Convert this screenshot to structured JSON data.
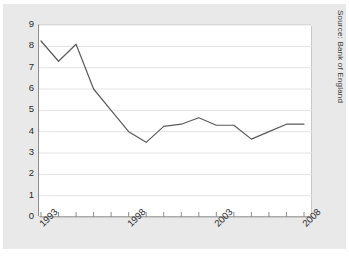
{
  "figure": {
    "source_note": "Source: Bank of England",
    "caption": ""
  },
  "colors": {
    "line": "#5a5a5a",
    "grid": "#e3e3e3",
    "axis": "#8d8d8d",
    "panel_background": "#e9e9e9",
    "plot_background": "#ffffff",
    "text": "#2b2b2b"
  },
  "chart_data": {
    "type": "line",
    "title": "",
    "xlabel": "",
    "ylabel": "",
    "xlim": [
      1993,
      2008
    ],
    "ylim": [
      0,
      9
    ],
    "ytick_step": 1,
    "grid": true,
    "legend": false,
    "yticks": [
      "0",
      "1",
      "2",
      "3",
      "4",
      "5",
      "6",
      "7",
      "8",
      "9"
    ],
    "xticks_all": [
      1993,
      1994,
      1995,
      1996,
      1997,
      1998,
      1999,
      2000,
      2001,
      2002,
      2003,
      2004,
      2005,
      2006,
      2007,
      2008
    ],
    "xticklabels": [
      "1993",
      "1998",
      "2003",
      "2008"
    ],
    "xticklabel_years": [
      1993,
      1998,
      2003,
      2008
    ],
    "x": [
      1993,
      1994,
      1995,
      1996,
      1997,
      1998,
      1999,
      2000,
      2001,
      2002,
      2003,
      2004,
      2005,
      2006,
      2007,
      2008
    ],
    "values": [
      8.25,
      7.3,
      8.1,
      6.0,
      5.0,
      4.0,
      3.5,
      4.25,
      4.35,
      4.65,
      4.3,
      4.3,
      3.65,
      4.0,
      4.35,
      4.35
    ],
    "series": [
      {
        "name": "rate",
        "values": [
          8.25,
          7.3,
          8.1,
          6.0,
          5.0,
          4.0,
          3.5,
          4.25,
          4.35,
          4.65,
          4.3,
          4.3,
          3.65,
          4.0,
          4.35,
          4.35
        ]
      }
    ]
  }
}
